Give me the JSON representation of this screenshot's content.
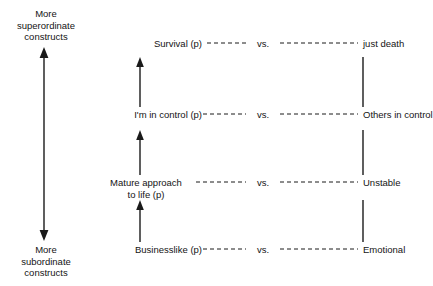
{
  "diagram": {
    "axis": {
      "name": "construct-hierarchy-axis",
      "top_label": "More\nsuperordinate\nconstructs",
      "bottom_label": "More\nsubordinate\nconstructs",
      "arrow_style": "double-headed-vertical",
      "color": "#1a1a1a"
    },
    "separator_label": "vs.",
    "connector_style": "dashed",
    "rows": [
      {
        "id": "row-survival",
        "left_pole": "Survival (p)",
        "separator": "vs.",
        "right_pole": "just death",
        "y": 44
      },
      {
        "id": "row-control",
        "left_pole": "I'm in control (p)",
        "separator": "vs.",
        "right_pole": "Others in control",
        "y": 115
      },
      {
        "id": "row-mature-approach",
        "left_pole": "Mature approach\nto life (p)",
        "separator": "vs.",
        "right_pole": "Unstable",
        "y": 183
      },
      {
        "id": "row-businesslike",
        "left_pole": "Businesslike (p)",
        "separator": "vs.",
        "right_pole": "Emotional",
        "y": 250
      }
    ],
    "left_links": [
      {
        "id": "link-businesslike-to-mature",
        "direction": "up"
      },
      {
        "id": "link-mature-to-control",
        "direction": "up"
      },
      {
        "id": "link-control-to-survival",
        "direction": "up"
      }
    ],
    "right_links": [
      {
        "id": "link-emotional-to-unstable",
        "direction": "none"
      },
      {
        "id": "link-unstable-to-others",
        "direction": "none"
      },
      {
        "id": "link-others-to-justdeath",
        "direction": "none"
      }
    ]
  }
}
